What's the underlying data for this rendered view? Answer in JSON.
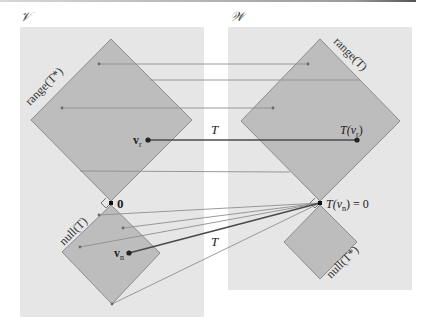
{
  "figure": {
    "colors": {
      "panel_bg": "#e6e6e6",
      "diamond_fill": "#bdbdbd",
      "diamond_stroke": "#8c8c8c",
      "thin_arrow": "#8f8f8f",
      "thick_arrow": "#4a4a4a",
      "point": "#333333"
    },
    "domain_space": {
      "title": "𝒱",
      "range_label": "range(T*)",
      "null_label": "null(T)",
      "zero_label": "0",
      "vr_label": "v",
      "vr_sub": "r",
      "vn_label": "v",
      "vn_sub": "n"
    },
    "codomain_space": {
      "title": "𝒲",
      "range_label": "range(T)",
      "null_label": "null(T*)",
      "tvr_label": "T(v",
      "tvr_sub": "r",
      "tvr_close": ")",
      "tvn_label": "T(v",
      "tvn_sub": "n",
      "tvn_close": ") = 0"
    },
    "map_labels": {
      "range_map": "T",
      "null_map": "T"
    }
  }
}
